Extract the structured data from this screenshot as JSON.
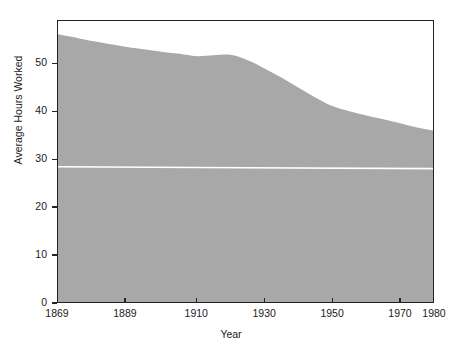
{
  "chart_data": {
    "type": "area",
    "title": "",
    "xlabel": "Year",
    "ylabel": "Average Hours Worked",
    "xlim": [
      1869,
      1980
    ],
    "ylim": [
      0,
      59
    ],
    "grid": false,
    "legend": null,
    "fill_color": "#a8a8a8",
    "axis_color": "#232323",
    "reference_line_color": "#ffffff",
    "x_ticks": [
      {
        "value": 1869,
        "label": "1869",
        "tick_mark": false
      },
      {
        "value": 1889,
        "label": "1889",
        "tick_mark": true
      },
      {
        "value": 1910,
        "label": "1910",
        "tick_mark": true
      },
      {
        "value": 1930,
        "label": "1930",
        "tick_mark": true
      },
      {
        "value": 1950,
        "label": "1950",
        "tick_mark": true
      },
      {
        "value": 1970,
        "label": "1970",
        "tick_mark": true
      },
      {
        "value": 1980,
        "label": "1980",
        "tick_mark": false
      }
    ],
    "y_ticks": [
      {
        "value": 0,
        "label": "0"
      },
      {
        "value": 10,
        "label": "10"
      },
      {
        "value": 20,
        "label": "20"
      },
      {
        "value": 30,
        "label": "30"
      },
      {
        "value": 40,
        "label": "40"
      },
      {
        "value": 50,
        "label": "50"
      }
    ],
    "series": [
      {
        "name": "Average Hours Worked",
        "kind": "area",
        "x": [
          1869,
          1875,
          1880,
          1889,
          1895,
          1900,
          1905,
          1910,
          1915,
          1920,
          1925,
          1930,
          1935,
          1940,
          1945,
          1950,
          1955,
          1960,
          1965,
          1970,
          1975,
          1980
        ],
        "values": [
          56.2,
          55.4,
          54.7,
          53.6,
          53.0,
          52.5,
          52.1,
          51.6,
          51.8,
          51.9,
          50.8,
          49.1,
          47.2,
          45.1,
          43.0,
          41.2,
          40.1,
          39.2,
          38.4,
          37.6,
          36.7,
          36.0
        ]
      },
      {
        "name": "Reference Line",
        "kind": "line",
        "x": [
          1869,
          1980
        ],
        "values": [
          28.4,
          28.0
        ]
      }
    ]
  },
  "axis_titles": {
    "x": "Year",
    "y": "Average Hours Worked"
  }
}
